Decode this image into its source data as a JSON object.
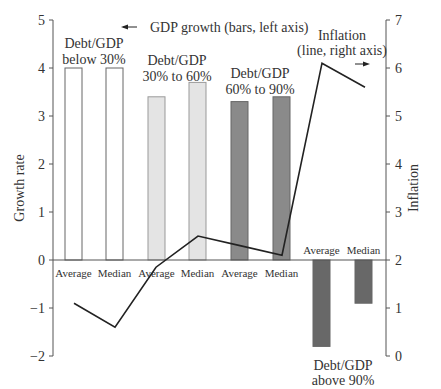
{
  "chart_data": {
    "type": "bar",
    "title": "",
    "categories": [
      "Average",
      "Median",
      "Average",
      "Median",
      "Average",
      "Median",
      "Average",
      "Median"
    ],
    "groups": [
      {
        "label_line1": "Debt/GDP",
        "label_line2": "below 30%",
        "fill": "#ffffff"
      },
      {
        "label_line1": "Debt/GDP",
        "label_line2": "30% to 60%",
        "fill": "#e4e4e4"
      },
      {
        "label_line1": "Debt/GDP",
        "label_line2": "60% to 90%",
        "fill": "#8a8a8a"
      },
      {
        "label_line1": "Debt/GDP",
        "label_line2": "above 90%",
        "fill": "#686868"
      }
    ],
    "series": [
      {
        "name": "GDP growth",
        "axis": "left",
        "type": "bar",
        "values": [
          4.0,
          4.0,
          3.4,
          3.7,
          3.3,
          3.4,
          -1.8,
          -0.9
        ]
      },
      {
        "name": "Inflation",
        "axis": "right",
        "type": "line",
        "values": [
          1.1,
          0.6,
          1.85,
          2.5,
          2.3,
          2.1,
          6.1,
          5.6
        ]
      }
    ],
    "ylabel": "Growth rate",
    "y2label": "Inflation",
    "ylim": [
      -2,
      5
    ],
    "y2lim": [
      0,
      7
    ],
    "yticks": [
      "5",
      "4",
      "3",
      "2",
      "1",
      "0",
      "−1",
      "−2"
    ],
    "y2ticks": [
      "7",
      "6",
      "5",
      "4",
      "3",
      "2",
      "1",
      "0"
    ],
    "annotations": {
      "bars_legend": "GDP growth (bars, left axis)",
      "line_legend_line1": "Inflation",
      "line_legend_line2": "(line, right axis)"
    },
    "grid": false
  }
}
